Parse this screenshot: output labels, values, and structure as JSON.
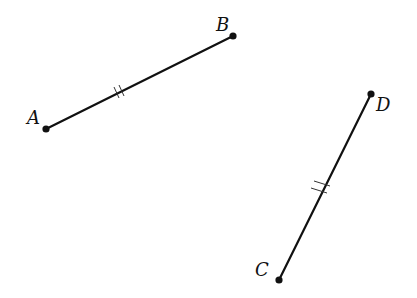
{
  "diagram": {
    "points": {
      "A": {
        "label": "A",
        "x": 46,
        "y": 129
      },
      "B": {
        "label": "B",
        "x": 233,
        "y": 36
      },
      "C": {
        "label": "C",
        "x": 279,
        "y": 280
      },
      "D": {
        "label": "D",
        "x": 371,
        "y": 94
      }
    },
    "segments": [
      {
        "name": "AB",
        "from": "A",
        "to": "B",
        "tick_marks": 2
      },
      {
        "name": "CD",
        "from": "C",
        "to": "D",
        "tick_marks": 2
      }
    ],
    "colors": {
      "line": "#111111",
      "background": "#ffffff"
    }
  }
}
